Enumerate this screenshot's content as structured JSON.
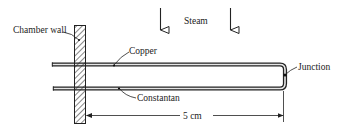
{
  "diagram": {
    "type": "thermocouple-schematic",
    "labels": {
      "chamber_wall": "Chamber wall",
      "steam": "Steam",
      "copper": "Copper",
      "constantan": "Constantan",
      "junction": "Junction",
      "dimension": "5 cm"
    },
    "components": [
      {
        "name": "chamber-wall",
        "style": "hatched"
      },
      {
        "name": "copper-wire",
        "material": "Copper"
      },
      {
        "name": "constantan-wire",
        "material": "Constantan"
      },
      {
        "name": "junction",
        "description": "U-bend joining copper and constantan wires"
      }
    ],
    "flow_arrows": {
      "count": 2,
      "direction": "down",
      "medium": "Steam"
    },
    "dimension": {
      "value": 5,
      "unit": "cm",
      "from": "chamber-wall",
      "to": "junction"
    },
    "colors": {
      "ink": "#222222",
      "wire_fill": "#e6e6e6",
      "background": "#ffffff"
    }
  }
}
